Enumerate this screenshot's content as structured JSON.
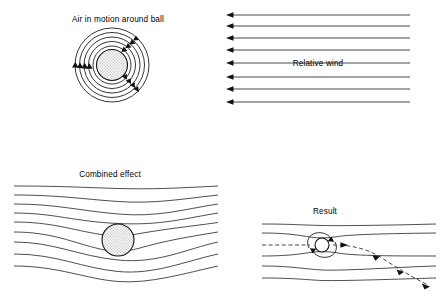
{
  "figure": {
    "background_color": "#ffffff",
    "line_color": "#222222",
    "width": 440,
    "height": 301
  },
  "panels": [
    {
      "id": "air-in-motion",
      "label": "Air in motion around ball",
      "label_x": 118,
      "label_y": 22,
      "description": "Concentric circular streamlines of air circulating around a shaded ball, with arrowheads showing clockwise-topward flow direction",
      "ball": {
        "cx": 112,
        "cy": 65,
        "r": 15.5,
        "fill": "stipple"
      },
      "ring_radii": [
        19,
        23.5,
        28,
        32.5,
        37
      ],
      "arrow_count": 11
    },
    {
      "id": "relative-wind",
      "label": "Relative wind",
      "label_x": 318,
      "label_y": 66,
      "description": "Eight horizontal parallel streamlines with arrowheads pointing left, representing uniform oncoming airflow",
      "line_count": 8,
      "x_start": 410,
      "x_end": 226,
      "y_values": [
        15,
        26,
        38,
        50,
        63,
        77,
        89,
        102
      ]
    },
    {
      "id": "combined-effect",
      "label": "Combined effect",
      "label_x": 110,
      "label_y": 177,
      "description": "Nine streamlines deflected downward as they pass a shaded ball, crowding above and spreading below",
      "ball": {
        "cx": 118,
        "cy": 240,
        "r": 16,
        "fill": "stipple"
      },
      "line_count": 9,
      "x_start": 14,
      "x_end": 218
    },
    {
      "id": "result",
      "label": "Result",
      "label_x": 325,
      "label_y": 214,
      "description": "Small ball with circulation arrows sits in deflected streamlines; a dashed trajectory arrow curves downward to the right showing the ball's deflected flight path",
      "ball": {
        "cx": 322,
        "cy": 245,
        "r": 7,
        "fill": "#ffffff"
      },
      "line_count": 6,
      "x_start": 262,
      "x_end": 436,
      "trajectory": {
        "style": "dashed",
        "direction": "curves downward to the right",
        "arrow_count": 4
      }
    }
  ]
}
